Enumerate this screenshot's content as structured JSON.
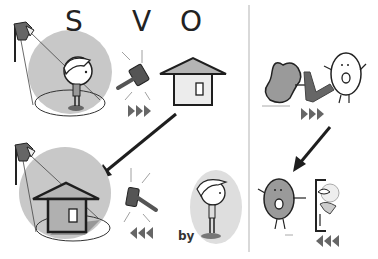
{
  "labels": {
    "subject": "S",
    "verb": "V",
    "object": "O",
    "by": "by"
  },
  "panels": {
    "active_sentence": {
      "roles": [
        "subject",
        "verb",
        "object"
      ],
      "direction": "forward"
    },
    "passive_sentence": {
      "roles": [
        "object",
        "verb",
        "by-agent"
      ],
      "direction": "backward"
    },
    "active_characters": {
      "direction": "forward"
    },
    "passive_characters": {
      "direction": "backward"
    }
  },
  "colors": {
    "spotlight_circle": "#c8c8c8",
    "agent_oval": "#dedede",
    "house_roof": "#b4b4b4",
    "house_wall": "#ececec",
    "outline": "#1e1e1e",
    "arrow_marks": "#666666",
    "divider": "#cccccc",
    "bean_fill": "#9a9a9a"
  }
}
